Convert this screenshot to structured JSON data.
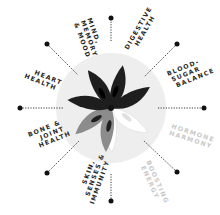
{
  "diagram": {
    "center": {
      "x": 111,
      "y": 108
    },
    "circle_radius": 55,
    "colors": {
      "circle": "#eeeeee",
      "spoke": "#222222",
      "dot": "#111111",
      "petal_dark": "#1e1e1e",
      "petal_gray": "#8c8c8c",
      "petal_white": "#ffffff",
      "petal_cutout": "#d9d9d9",
      "label_dark": "#2a2a2a",
      "label_light": "#c8c8c8"
    },
    "labels": [
      {
        "id": "mind",
        "lines": [
          "MIND,",
          "MEMORY",
          "& MOOD"
        ]
      },
      {
        "id": "digestive",
        "lines": [
          "DIGESTIVE",
          "HEALTH"
        ]
      },
      {
        "id": "blood-sugar",
        "lines": [
          "BLOOD-",
          "SUGAR",
          "BALANCE"
        ]
      },
      {
        "id": "hormone",
        "lines": [
          "HORMONE",
          "HARMONY"
        ]
      },
      {
        "id": "energy",
        "lines": [
          "ENERGY",
          "BOOSTING"
        ]
      },
      {
        "id": "skin",
        "lines": [
          "SKIN,",
          "SENSES &",
          "IMMUNITY"
        ]
      },
      {
        "id": "bone",
        "lines": [
          "BONE &",
          "JOINT",
          "HEALTH"
        ]
      },
      {
        "id": "heart",
        "lines": [
          "HEART",
          "HEALTH"
        ]
      }
    ]
  }
}
